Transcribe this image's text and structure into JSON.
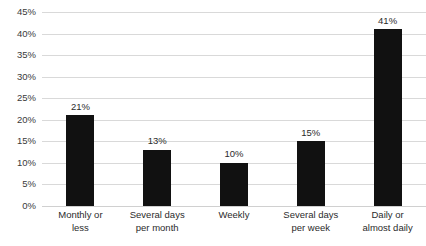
{
  "chart_data": {
    "type": "bar",
    "title": "",
    "subtitle": "",
    "xlabel": "",
    "ylabel": "",
    "categories": [
      "Monthly or\nless",
      "Several days\nper month",
      "Weekly",
      "Several days\nper week",
      "Daily or\nalmost daily"
    ],
    "values": [
      21,
      13,
      10,
      15,
      41
    ],
    "value_labels": [
      "21%",
      "13%",
      "10%",
      "15%",
      "41%"
    ],
    "ylim": [
      0,
      45
    ],
    "ytick_values": [
      45,
      40,
      35,
      30,
      25,
      20,
      15,
      10,
      5,
      0
    ],
    "ytick_labels": [
      "45%",
      "40%",
      "35%",
      "30%",
      "25%",
      "20%",
      "15%",
      "10%",
      "5%",
      "0%"
    ],
    "grid": true,
    "legend": false,
    "legend_position": "none",
    "colors": {
      "bar": "#111111",
      "gridline": "#d9d9d9",
      "background": "#ffffff",
      "text": "#2b2b2b"
    }
  }
}
